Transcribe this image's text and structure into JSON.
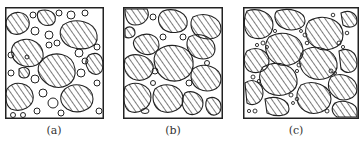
{
  "figure": {
    "panels": [
      {
        "id": "a",
        "label": "(a)",
        "description": "large hatched grains with many small grains between them"
      },
      {
        "id": "b",
        "label": "(b)",
        "description": "hatched grains filling most of the area, fewer small grains"
      },
      {
        "id": "c",
        "label": "(c)",
        "description": "densely packed hatched grains with tiny grains at junctions"
      }
    ]
  },
  "colors": {
    "line": "#222222",
    "background": "#ffffff"
  }
}
